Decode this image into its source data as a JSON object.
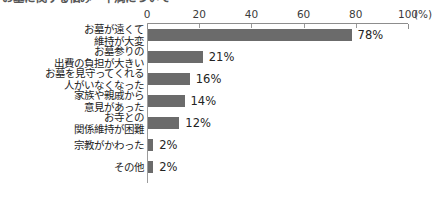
{
  "chart_title": "お墓に関する悩み・不満について",
  "chart_data": {
    "type": "bar",
    "orientation": "horizontal",
    "title": "お墓に関する悩み・不満について",
    "title_clipped": true,
    "xlabel": "(%)",
    "ylabel": "",
    "unit_label": "(%)",
    "xlim": [
      0,
      100
    ],
    "xticks": [
      0,
      20,
      40,
      60,
      80,
      100
    ],
    "xtick_labels": [
      "0",
      "20",
      "40",
      "60",
      "80",
      "100"
    ],
    "grid": false,
    "legend": false,
    "bar_color": "#6b6b6b",
    "axis_color": "#8d8d8d",
    "categories": [
      "お墓が遠くて\n維持が大変",
      "お墓参りの\n出費の負担が大きい",
      "お墓を見守ってくれる\n人がいなくなった",
      "家族や親戚から\n意見があった",
      "お寺との\n関係維持が困難",
      "宗教がかわった",
      "その他"
    ],
    "values": [
      78,
      21,
      16,
      14,
      12,
      2,
      2
    ],
    "value_labels": [
      "78%",
      "21%",
      "16%",
      "14%",
      "12%",
      "2%",
      "2%"
    ]
  },
  "rows": [
    {
      "label": "お墓が遠くて\n維持が大変",
      "value": 78,
      "value_label": "78%"
    },
    {
      "label": "お墓参りの\n出費の負担が大きい",
      "value": 21,
      "value_label": "21%"
    },
    {
      "label": "お墓を見守ってくれる\n人がいなくなった",
      "value": 16,
      "value_label": "16%"
    },
    {
      "label": "家族や親戚から\n意見があった",
      "value": 14,
      "value_label": "14%"
    },
    {
      "label": "お寺との\n関係維持が困難",
      "value": 12,
      "value_label": "12%"
    },
    {
      "label": "宗教がかわった",
      "value": 2,
      "value_label": "2%"
    },
    {
      "label": "その他",
      "value": 2,
      "value_label": "2%"
    }
  ],
  "axis": {
    "ticks": [
      "0",
      "20",
      "40",
      "60",
      "80",
      "100"
    ],
    "unit": "(%)"
  }
}
